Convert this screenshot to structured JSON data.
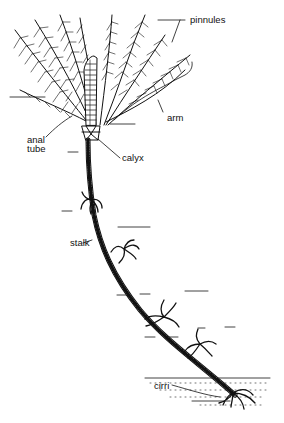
{
  "diagram": {
    "labels": {
      "pinnules": "pinnules",
      "arm": "arm",
      "anal_tube_line1": "anal",
      "anal_tube_line2": "tube",
      "calyx": "calyx",
      "stalk": "stalk",
      "cirri": "cirri"
    },
    "colors": {
      "ink": "#111111",
      "background": "#ffffff"
    }
  }
}
